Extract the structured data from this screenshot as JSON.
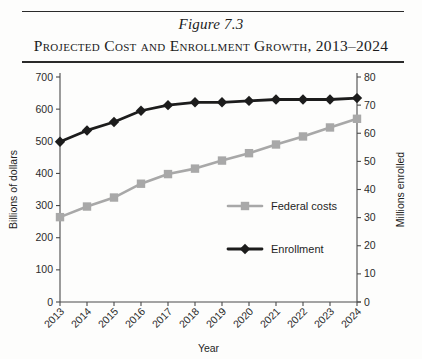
{
  "figure": {
    "number_label": "Figure 7.3",
    "title": "Projected Cost and Enrollment Growth, 2013–2024"
  },
  "chart_data": {
    "type": "line",
    "title": "Projected Cost and Enrollment Growth, 2013–2024",
    "xlabel": "Year",
    "ylabel": "Billions of dollars",
    "y2label": "Millions enrolled",
    "grid": false,
    "legend_position": "inside-right",
    "categories": [
      "2013",
      "2014",
      "2015",
      "2016",
      "2017",
      "2018",
      "2019",
      "2020",
      "2021",
      "2022",
      "2023",
      "2024"
    ],
    "xtick_rotation": 45,
    "ylim": [
      0,
      700
    ],
    "yticks": [
      0,
      100,
      200,
      300,
      400,
      500,
      600,
      700
    ],
    "y2lim": [
      0,
      80
    ],
    "y2ticks": [
      0,
      10,
      20,
      30,
      40,
      50,
      60,
      70,
      80
    ],
    "series": [
      {
        "name": "Federal costs",
        "axis": "left",
        "units": "billions of dollars",
        "color": "#a8a8a8",
        "marker": "square",
        "values": [
          264,
          297,
          325,
          368,
          398,
          415,
          440,
          463,
          490,
          515,
          543,
          570
        ]
      },
      {
        "name": "Enrollment",
        "axis": "right",
        "units": "millions enrolled",
        "color": "#1c1c1c",
        "marker": "diamond",
        "values": [
          57,
          61,
          64,
          68,
          70,
          71,
          71,
          71.5,
          72,
          72,
          72,
          72.5
        ]
      }
    ]
  },
  "legend": {
    "items": [
      {
        "label": "Federal costs"
      },
      {
        "label": "Enrollment"
      }
    ]
  }
}
